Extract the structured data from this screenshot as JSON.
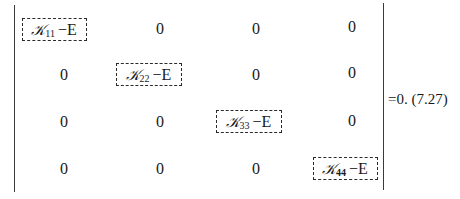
{
  "equation": {
    "type": "determinant",
    "size": "4x4",
    "label": "=0. (7.27)",
    "matrix": [
      [
        {
          "boxed": true,
          "symbol": "𝒦",
          "subscript": "11",
          "suffix": "−E"
        },
        {
          "value": "0"
        },
        {
          "value": "0"
        },
        {
          "value": "0"
        }
      ],
      [
        {
          "value": "0"
        },
        {
          "boxed": true,
          "symbol": "𝒦",
          "subscript": "22",
          "suffix": "−E"
        },
        {
          "value": "0"
        },
        {
          "value": "0"
        }
      ],
      [
        {
          "value": "0"
        },
        {
          "value": "0"
        },
        {
          "boxed": true,
          "symbol": "𝒦",
          "subscript": "33",
          "suffix": "−E"
        },
        {
          "value": "0"
        }
      ],
      [
        {
          "value": "0"
        },
        {
          "value": "0"
        },
        {
          "value": "0"
        },
        {
          "boxed": true,
          "symbol": "𝒦",
          "subscript": "44",
          "suffix": "−E"
        }
      ]
    ]
  }
}
